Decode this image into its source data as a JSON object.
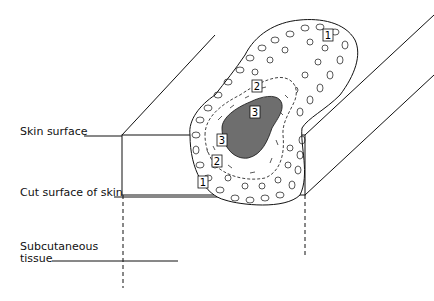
{
  "labels": {
    "skin_surface": "Skin surface",
    "cut_surface": "Cut surface of skin",
    "subcutaneous_line1": "Subcutaneous",
    "subcutaneous_line2": "tissue"
  },
  "zone_markers": {
    "zone1_top": "1",
    "zone1_front": "1",
    "zone2_top": "2",
    "zone2_front": "2",
    "zone3_top": "3",
    "zone3_front": "3"
  },
  "colors": {
    "line": "#111111",
    "zone3_fill": "#6e6e6e",
    "background": "#ffffff"
  }
}
